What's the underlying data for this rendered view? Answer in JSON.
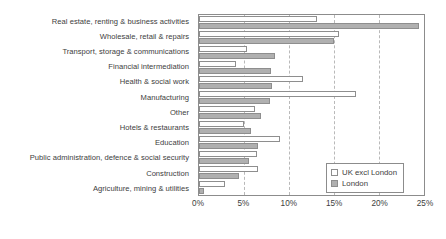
{
  "chart_data": {
    "type": "bar",
    "orientation": "horizontal",
    "title": "",
    "subtitle": "",
    "xlabel": "",
    "ylabel": "",
    "xlim": [
      0,
      25
    ],
    "xunit": "%",
    "xticks": [
      0,
      5,
      10,
      15,
      20,
      25
    ],
    "xtick_labels": [
      "0%",
      "5%",
      "10%",
      "15%",
      "20%",
      "25%"
    ],
    "grid": true,
    "grid_axis": "x",
    "grid_style": "dashed",
    "legend_position": "bottom-right",
    "categories": [
      "Real estate, renting & business activities",
      "Wholesale, retail & repairs",
      "Transport, storage & communications",
      "Financial intermediation",
      "Health & social work",
      "Manufacturing",
      "Other",
      "Hotels & restaurants",
      "Education",
      "Public administration, defence & social security",
      "Construction",
      "Agriculture, mining & utilities"
    ],
    "series": [
      {
        "name": "UK excl London",
        "color": "#ffffff",
        "values": [
          13.1,
          15.5,
          5.3,
          4.1,
          11.6,
          17.4,
          6.2,
          5.0,
          9.0,
          6.4,
          6.5,
          2.9
        ]
      },
      {
        "name": "London",
        "color": "#b0b0b0",
        "values": [
          24.4,
          15.0,
          8.4,
          8.0,
          8.1,
          7.9,
          6.9,
          5.8,
          6.5,
          5.6,
          4.4,
          0.5
        ]
      }
    ]
  },
  "legend": {
    "items": [
      {
        "label": "UK excl London",
        "swatch": "uk"
      },
      {
        "label": "London",
        "swatch": "london"
      }
    ]
  }
}
